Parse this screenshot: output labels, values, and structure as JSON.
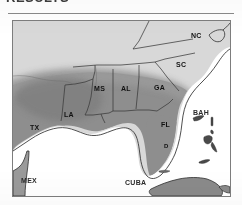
{
  "page": {
    "header_fragment": "RESULTS",
    "background_color": "#ffffff",
    "rule_color": "#8a8a8a"
  },
  "figure": {
    "frame_color": "#7d7d7d",
    "ocean_color": "#ffffff",
    "unshaded_land_color": "#d8d8d8",
    "shaded_range_color": "#8e8e8e",
    "outline_color": "#4a4a4a",
    "border_color": "#2f2f2f"
  },
  "labels": {
    "states": [
      {
        "code": "NC",
        "name": "north-carolina",
        "x": 178,
        "y": 11
      },
      {
        "code": "SC",
        "name": "south-carolina",
        "x": 163,
        "y": 40
      },
      {
        "code": "GA",
        "name": "georgia",
        "x": 141,
        "y": 63
      },
      {
        "code": "AL",
        "name": "alabama",
        "x": 108,
        "y": 64
      },
      {
        "code": "MS",
        "name": "mississippi",
        "x": 81,
        "y": 64
      },
      {
        "code": "LA",
        "name": "louisiana",
        "x": 51,
        "y": 90
      },
      {
        "code": "TX",
        "name": "texas",
        "x": 17,
        "y": 103
      },
      {
        "code": "FL",
        "name": "florida",
        "x": 148,
        "y": 100
      }
    ],
    "countries": [
      {
        "code": "MEX",
        "name": "mexico",
        "x": 8,
        "y": 158
      },
      {
        "code": "CUBA",
        "name": "cuba",
        "x": 112,
        "y": 160
      },
      {
        "code": "BAH",
        "name": "bahamas",
        "x": 180,
        "y": 105
      }
    ],
    "markers": [
      {
        "code": "D",
        "name": "locality-marker-south-florida",
        "x": 151,
        "y": 124
      }
    ]
  }
}
